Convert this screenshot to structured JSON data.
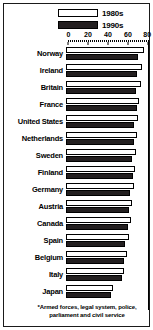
{
  "legend": {
    "position": "top-right",
    "entries": [
      {
        "label": "1980s",
        "swatch": "light",
        "color": "#ffffff"
      },
      {
        "label": "1990s",
        "swatch": "dark",
        "color": "#231f20"
      }
    ]
  },
  "footnote": "*Armed forces, legal system, police, parliament and civil service",
  "chart_data": {
    "type": "bar",
    "orientation": "horizontal",
    "title": "",
    "subtitle": "",
    "xlabel": "",
    "ylabel": "",
    "xlim": [
      0,
      80
    ],
    "ticks": [
      0,
      20,
      40,
      60,
      80
    ],
    "grid": false,
    "legend_position": "top-right",
    "categories": [
      "Norway",
      "Ireland",
      "Britain",
      "France",
      "United States",
      "Netherlands",
      "Sweden",
      "Finland",
      "Germany",
      "Austria",
      "Canada",
      "Spain",
      "Belgium",
      "Italy",
      "Japan"
    ],
    "series": [
      {
        "name": "1980s",
        "color": "#ffffff",
        "values": [
          78,
          76,
          75,
          73,
          72,
          71,
          70,
          69,
          68,
          66,
          65,
          63,
          61,
          58,
          47
        ]
      },
      {
        "name": "1990s",
        "color": "#231f20",
        "values": [
          72,
          71,
          70,
          71,
          68,
          68,
          66,
          67,
          64,
          63,
          62,
          59,
          58,
          56,
          45
        ]
      }
    ]
  }
}
